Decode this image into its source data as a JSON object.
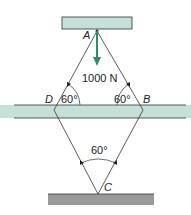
{
  "diagram": {
    "points": {
      "A": {
        "label": "A"
      },
      "B": {
        "label": "B"
      },
      "C": {
        "label": "C"
      },
      "D": {
        "label": "D"
      }
    },
    "load": {
      "label": "1000 N",
      "color": "#2e8b6e"
    },
    "angles": {
      "D": "60°",
      "B": "60°",
      "C": "60°"
    },
    "colors": {
      "support_fill": "#c5e0d8",
      "ground_fill": "#9a9a9a",
      "line": "#333333"
    }
  }
}
